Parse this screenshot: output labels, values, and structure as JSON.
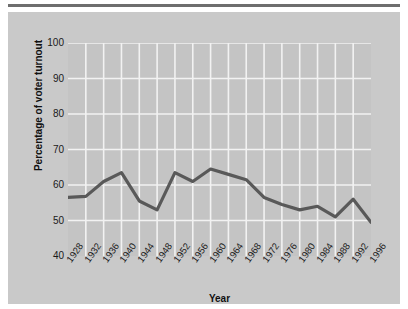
{
  "chart_data": {
    "type": "line",
    "title": "",
    "xlabel": "Year",
    "ylabel": "Percentage of voter turnout",
    "categories": [
      "1928",
      "1932",
      "1936",
      "1940",
      "1944",
      "1948",
      "1952",
      "1956",
      "1960",
      "1964",
      "1968",
      "1972",
      "1976",
      "1980",
      "1984",
      "1988",
      "1992",
      "1996"
    ],
    "values": [
      56.5,
      56.8,
      61.0,
      63.5,
      55.5,
      53.0,
      63.5,
      61.0,
      64.5,
      63.0,
      61.5,
      56.5,
      54.5,
      53.0,
      54.0,
      51.0,
      56.0,
      49.5
    ],
    "series": [
      {
        "name": "Voter turnout",
        "values": [
          56.5,
          56.8,
          61.0,
          63.5,
          55.5,
          53.0,
          63.5,
          61.0,
          64.5,
          63.0,
          61.5,
          56.5,
          54.5,
          53.0,
          54.0,
          51.0,
          56.0,
          49.5
        ]
      }
    ],
    "ylim": [
      40,
      100
    ],
    "yticks": [
      100,
      90,
      80,
      70,
      60,
      50,
      40
    ],
    "ytick_labels": [
      "100",
      "90",
      "80",
      "70",
      "60",
      "50",
      "40"
    ],
    "grid": true,
    "legend": "none",
    "line_color": "#595959",
    "plot_background": "#c4c4c4",
    "panel_background": "#c9c9c9",
    "gridline_color": "#f2f2f2",
    "axis_text_color": "#1a1a1a"
  }
}
